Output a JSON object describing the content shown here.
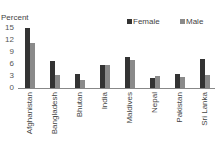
{
  "chart_data": {
    "type": "bar",
    "title": "",
    "xlabel": "",
    "ylabel": "Percent",
    "ylim": [
      0,
      15
    ],
    "yticks": [
      0,
      3,
      6,
      9,
      12,
      15
    ],
    "grid": false,
    "legend_position": "top-right",
    "categories": [
      "Afghanistan",
      "Bangladesh",
      "Bhutan",
      "India",
      "Maldives",
      "Nepal",
      "Pakistan",
      "Sri Lanka"
    ],
    "series": [
      {
        "name": "Female",
        "color": "#333333",
        "values": [
          14.9,
          6.8,
          3.5,
          5.8,
          7.7,
          2.6,
          3.6,
          7.2
        ]
      },
      {
        "name": "Male",
        "color": "#8a8a8a",
        "values": [
          11.2,
          3.3,
          2.0,
          5.8,
          7.0,
          3.1,
          2.8,
          3.3
        ]
      }
    ]
  },
  "axis": {
    "ylabel": "Percent",
    "ticks": [
      "15",
      "12",
      "9",
      "6",
      "3",
      "0"
    ]
  },
  "legend": {
    "female": "Female",
    "male": "Male"
  }
}
